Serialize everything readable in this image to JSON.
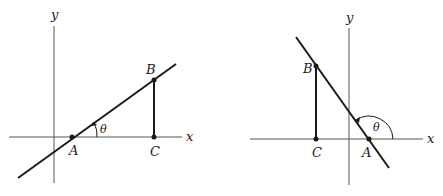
{
  "figures": [
    {
      "id": "left",
      "description": "Line with positive slope, acute angle theta",
      "axis_x_label": "x",
      "axis_y_label": "y",
      "point_A": "A",
      "point_B": "B",
      "point_C": "C",
      "angle_label": "θ"
    },
    {
      "id": "right",
      "description": "Line with negative slope, obtuse angle theta",
      "axis_x_label": "x",
      "axis_y_label": "y",
      "point_A": "A",
      "point_B": "B",
      "point_C": "C",
      "angle_label": "θ"
    }
  ],
  "colors": {
    "stroke": "#1a1a1a",
    "axis": "#555555"
  }
}
